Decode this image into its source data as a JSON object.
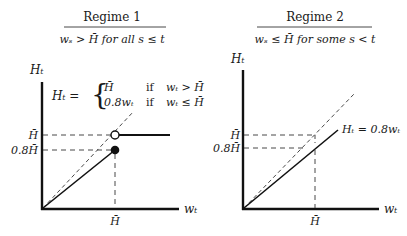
{
  "panels": [
    {
      "title": "Regime 1",
      "condition": "wₛ > H̄ for all s ≤ t",
      "y_axis_label": "Hₜ",
      "x_axis_label": "wₜ",
      "x_tick": "H̄",
      "y_ticks": [
        "H̄",
        "0.8H̄"
      ],
      "rule_lhs": "Hₜ =",
      "rule_cases": [
        {
          "value": "H̄",
          "cond_word": "if",
          "cond": "wₜ > H̄"
        },
        {
          "value": "0.8wₜ",
          "cond_word": "if",
          "cond": "wₜ ≤ H̄"
        }
      ]
    },
    {
      "title": "Regime 2",
      "condition": "wₛ ≤ H̄ for some s < t",
      "y_axis_label": "Hₜ",
      "x_axis_label": "wₜ",
      "x_tick": "H̄",
      "y_ticks": [
        "H̄",
        "0.8H̄"
      ],
      "line_label": "Hₜ = 0.8wₜ"
    }
  ]
}
